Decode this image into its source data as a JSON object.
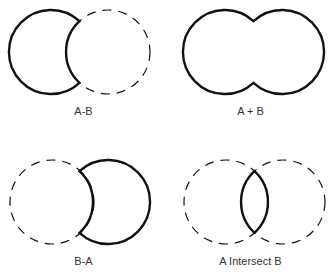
{
  "panels": [
    {
      "id": "a-minus-b",
      "label": "A-B"
    },
    {
      "id": "a-plus-b",
      "label": "A + B"
    },
    {
      "id": "b-minus-a",
      "label": "B-A"
    },
    {
      "id": "a-intersect-b",
      "label": "A Intersect B"
    }
  ],
  "colors": {
    "stroke": "#111111",
    "label": "#333333",
    "background": "#ffffff"
  }
}
